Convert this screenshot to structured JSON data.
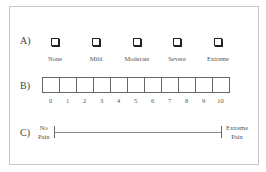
{
  "sections": {
    "a": {
      "label": "A)",
      "options": [
        {
          "label": "None"
        },
        {
          "label": "Mild"
        },
        {
          "label": "Moderate"
        },
        {
          "label": "Severe"
        },
        {
          "label": "Extreme"
        }
      ]
    },
    "b": {
      "label": "B)",
      "numbers": [
        "0",
        "1",
        "2",
        "3",
        "4",
        "5",
        "6",
        "7",
        "8",
        "9",
        "10"
      ]
    },
    "c": {
      "label": "C)",
      "left_anchor_line1": "No",
      "left_anchor_line2": "Pain",
      "right_anchor_line1": "Extreme",
      "right_anchor_line2": "Pain"
    }
  }
}
